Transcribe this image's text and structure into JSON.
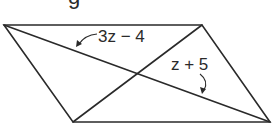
{
  "figure": {
    "shape": "parallelogram",
    "vertices": [
      {
        "name": "top-left",
        "x": 4,
        "y": 25
      },
      {
        "name": "top-right",
        "x": 202,
        "y": 25
      },
      {
        "name": "bottom-right",
        "x": 270,
        "y": 122
      },
      {
        "name": "bottom-left",
        "x": 73,
        "y": 122
      }
    ],
    "diagonals": [
      {
        "from": "top-left",
        "to": "bottom-right"
      },
      {
        "from": "top-right",
        "to": "bottom-left"
      }
    ],
    "stroke_color": "#2a2a2a",
    "background_color": "#ffffff"
  },
  "labels": {
    "upper_segment": "3z − 4",
    "lower_segment": "z + 5"
  },
  "cropped_text_fragment": "g"
}
